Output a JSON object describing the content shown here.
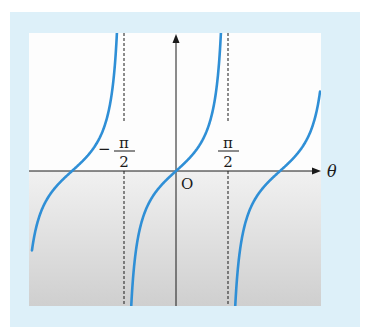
{
  "chart_data": {
    "type": "line",
    "title": "",
    "function": "tan(theta)",
    "xlabel": "θ",
    "ylabel": "",
    "origin_label": "O",
    "xlim_radians": [
      -1.385,
      1.385
    ],
    "xlim_unit": "π",
    "asymptotes": [
      {
        "x_pi": -0.5,
        "label_sign": "−",
        "label_num": "π",
        "label_den": "2"
      },
      {
        "x_pi": 0.5,
        "label_sign": "",
        "label_num": "π",
        "label_den": "2"
      }
    ],
    "zeros_pi": [
      -1,
      0,
      1
    ],
    "series": [
      {
        "name": "branch-left",
        "x_pi_range": [
          -1.385,
          -0.5
        ]
      },
      {
        "name": "branch-middle",
        "x_pi_range": [
          -0.5,
          0.5
        ]
      },
      {
        "name": "branch-right",
        "x_pi_range": [
          0.5,
          1.385
        ]
      }
    ],
    "grid": false,
    "legend": "none"
  },
  "colors": {
    "curve": "#2f8fd6",
    "frame": "#ddf0f9",
    "axis": "#1a1a1a"
  }
}
